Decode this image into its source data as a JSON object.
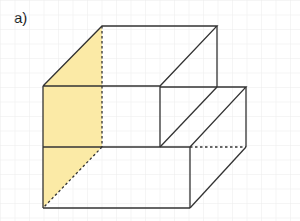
{
  "figure": {
    "label": "a)",
    "colors": {
      "grid": "#ececec",
      "edge": "#333333",
      "shade": "#fbeaa6"
    },
    "grid_spacing": 14.5
  }
}
